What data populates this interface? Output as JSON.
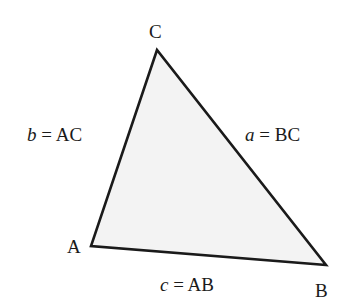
{
  "diagram": {
    "type": "triangle",
    "vertices": {
      "A": {
        "label": "A",
        "x": 91,
        "y": 246
      },
      "B": {
        "label": "B",
        "x": 326,
        "y": 265
      },
      "C": {
        "label": "C",
        "x": 157,
        "y": 50
      }
    },
    "sides": {
      "a": {
        "var": "a",
        "eq": " = ",
        "name": "BC"
      },
      "b": {
        "var": "b",
        "eq": " = ",
        "name": "AC"
      },
      "c": {
        "var": "c",
        "eq": " = ",
        "name": "AB"
      }
    },
    "colors": {
      "stroke": "#1a1a1a",
      "fill": "#f3f3f3",
      "background": "#ffffff"
    }
  }
}
